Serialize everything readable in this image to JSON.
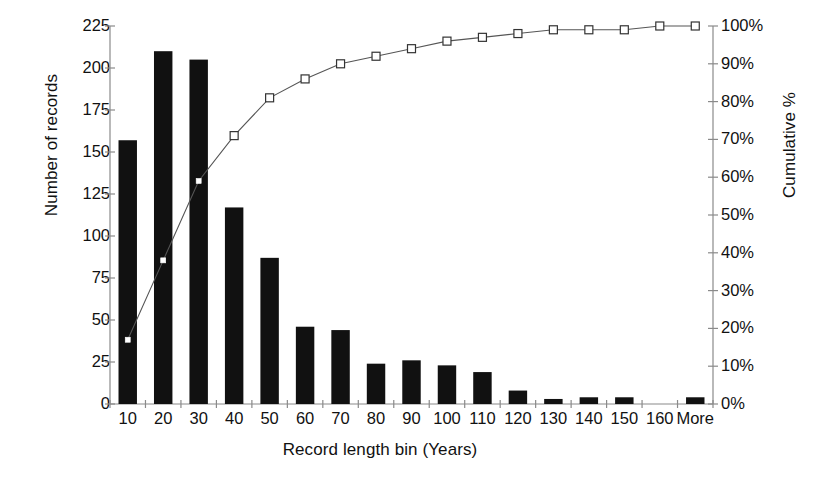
{
  "chart_data": {
    "type": "bar",
    "title": "",
    "subtitle": "",
    "xlabel": "Record length bin (Years)",
    "ylabel": "Number of records",
    "y2label": "Cumulative %",
    "categories": [
      "10",
      "20",
      "30",
      "40",
      "50",
      "60",
      "70",
      "80",
      "90",
      "100",
      "110",
      "120",
      "130",
      "140",
      "150",
      "160",
      "More"
    ],
    "series": [
      {
        "name": "Number of records",
        "type": "bar",
        "axis": "left",
        "color": "#111111",
        "values": [
          157,
          210,
          205,
          117,
          87,
          46,
          44,
          24,
          26,
          23,
          19,
          8,
          3,
          4,
          4,
          0,
          4
        ]
      },
      {
        "name": "Cumulative %",
        "type": "line",
        "axis": "right",
        "color": "#555555",
        "marker": "square-open",
        "values": [
          17,
          38,
          59,
          71,
          81,
          86,
          90,
          92,
          94,
          96,
          97,
          98,
          99,
          99,
          99,
          100,
          100
        ]
      }
    ],
    "ylim": [
      0,
      225
    ],
    "yticks": [
      0,
      25,
      50,
      75,
      100,
      125,
      150,
      175,
      200,
      225
    ],
    "ytick_labels": [
      "0",
      "25",
      "50",
      "75",
      "100",
      "125",
      "150",
      "175",
      "200",
      "225"
    ],
    "y2lim": [
      0,
      100
    ],
    "y2ticks": [
      0,
      10,
      20,
      30,
      40,
      50,
      60,
      70,
      80,
      90,
      100
    ],
    "y2tick_labels": [
      "0%",
      "10%",
      "20%",
      "30%",
      "40%",
      "50%",
      "60%",
      "70%",
      "80%",
      "90%",
      "100%"
    ],
    "grid": false,
    "legend": "none",
    "background": "#ffffff"
  }
}
